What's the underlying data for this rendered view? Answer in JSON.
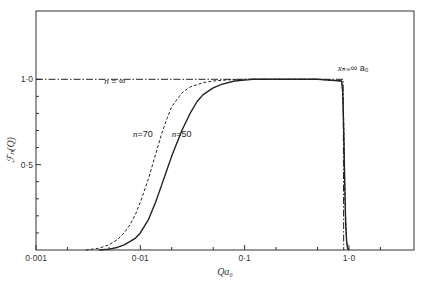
{
  "chart_data": {
    "type": "line",
    "title": "",
    "xlabel": "Qa₀",
    "ylabel": "ℱₙ(Q)",
    "xscale": "log",
    "xlim": [
      0.001,
      4.2
    ],
    "ylim": [
      0,
      1.4
    ],
    "grid": false,
    "x_ticks": [
      {
        "value": 0.001,
        "label": "0·001"
      },
      {
        "value": 0.01,
        "label": "0·01"
      },
      {
        "value": 0.1,
        "label": "0·1"
      },
      {
        "value": 1.0,
        "label": "1·0"
      }
    ],
    "x_minor_ticks": [
      0.002,
      0.005,
      0.02,
      0.05,
      0.2,
      0.5,
      2
    ],
    "y_ticks": [
      {
        "value": 0.5,
        "label": "0·5"
      },
      {
        "value": 1.0,
        "label": "1·0"
      }
    ],
    "y_minor_ticks": [
      0.1,
      0.2,
      0.3,
      0.4,
      0.6,
      0.7,
      0.8,
      0.9
    ],
    "series": [
      {
        "name": "n = ∞",
        "style": "dash-dot",
        "x": [
          0.001,
          0.005,
          0.05,
          0.5,
          0.88,
          0.885,
          0.89
        ],
        "y": [
          1.0,
          1.0,
          1.0,
          1.0,
          1.0,
          0.5,
          0.0
        ]
      },
      {
        "name": "n=70",
        "style": "dashed",
        "x": [
          0.003,
          0.004,
          0.005,
          0.006,
          0.007,
          0.008,
          0.009,
          0.01,
          0.012,
          0.014,
          0.016,
          0.018,
          0.02,
          0.025,
          0.03,
          0.04,
          0.05,
          0.07,
          0.1,
          0.2,
          0.5,
          0.85,
          0.88,
          0.9,
          0.92,
          0.95,
          0.98
        ],
        "y": [
          0.0,
          0.01,
          0.03,
          0.06,
          0.1,
          0.15,
          0.21,
          0.28,
          0.42,
          0.56,
          0.68,
          0.77,
          0.84,
          0.92,
          0.955,
          0.98,
          0.99,
          0.997,
          1.0,
          1.0,
          1.0,
          0.99,
          0.9,
          0.6,
          0.25,
          0.05,
          0.0
        ]
      },
      {
        "name": "n=50",
        "style": "solid",
        "x": [
          0.004,
          0.005,
          0.006,
          0.007,
          0.008,
          0.009,
          0.01,
          0.012,
          0.014,
          0.016,
          0.018,
          0.02,
          0.025,
          0.03,
          0.035,
          0.04,
          0.05,
          0.06,
          0.08,
          0.1,
          0.12,
          0.2,
          0.5,
          0.85,
          0.87,
          0.89,
          0.91,
          0.93,
          0.95,
          0.97,
          1.0
        ],
        "y": [
          0.0,
          0.005,
          0.015,
          0.03,
          0.05,
          0.07,
          0.1,
          0.18,
          0.28,
          0.38,
          0.47,
          0.55,
          0.7,
          0.8,
          0.87,
          0.91,
          0.95,
          0.97,
          0.99,
          0.995,
          1.0,
          1.0,
          1.0,
          0.99,
          0.93,
          0.7,
          0.4,
          0.15,
          0.05,
          0.01,
          0.0
        ]
      }
    ],
    "annotations": [
      {
        "text_main": "n",
        "text_rest": " = ∞",
        "x": 0.0045,
        "y": 0.97
      },
      {
        "text_main": "n",
        "text_rest": "=70",
        "x": 0.0085,
        "y": 0.66
      },
      {
        "text_main": "n",
        "text_rest": "=50",
        "x": 0.02,
        "y": 0.66
      },
      {
        "text_main": "x",
        "text_rest": "ₙ₌∞ a₀",
        "x": 0.78,
        "y": 1.05
      }
    ]
  }
}
